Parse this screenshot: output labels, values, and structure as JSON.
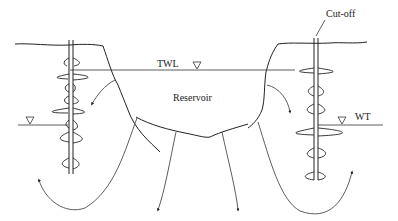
{
  "diagram": {
    "labels": {
      "twl": "TWL",
      "reservoir": "Reservoir",
      "cutoff": "Cut-off",
      "wt": "WT"
    },
    "symbols": {
      "water_level_marker": "inverted-triangle"
    },
    "colors": {
      "line": "#222222",
      "background": "#ffffff"
    }
  }
}
